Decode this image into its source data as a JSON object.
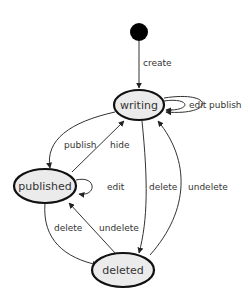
{
  "diagram": {
    "type": "state-machine",
    "start": {
      "label": ""
    },
    "nodes": {
      "writing": "writing",
      "published": "published",
      "deleted": "deleted"
    },
    "edges": {
      "create": "create",
      "writing_edit": "edit",
      "writing_publish": "publish",
      "publish_to_published": "publish",
      "hide": "hide",
      "published_edit": "edit",
      "writing_delete": "delete",
      "writing_undelete": "undelete",
      "published_delete": "delete",
      "published_undelete": "undelete"
    },
    "transitions": [
      {
        "from": "start",
        "to": "writing",
        "label": "create"
      },
      {
        "from": "writing",
        "to": "writing",
        "label": "edit"
      },
      {
        "from": "writing",
        "to": "writing",
        "label": "publish"
      },
      {
        "from": "writing",
        "to": "published",
        "label": "publish"
      },
      {
        "from": "published",
        "to": "writing",
        "label": "hide"
      },
      {
        "from": "published",
        "to": "published",
        "label": "edit"
      },
      {
        "from": "writing",
        "to": "deleted",
        "label": "delete"
      },
      {
        "from": "deleted",
        "to": "writing",
        "label": "undelete"
      },
      {
        "from": "published",
        "to": "deleted",
        "label": "delete"
      },
      {
        "from": "deleted",
        "to": "published",
        "label": "undelete"
      }
    ],
    "colors": {
      "node_fill": "#ebebeb",
      "node_stroke": "#111111",
      "edge": "#333333",
      "start": "#000000"
    }
  }
}
